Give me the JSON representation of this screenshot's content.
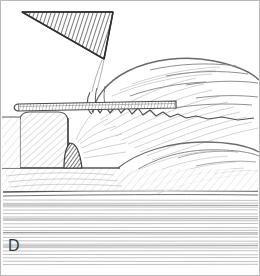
{
  "figure": {
    "panel_label": "D",
    "caption_text": "",
    "background_color": "#ffffff",
    "border_color": "#b9b9b9",
    "ink_color": "#3a3a3a",
    "hatch_color": "#9a9a9a",
    "dark_fill_color": "#6e6e6e",
    "width": 260,
    "height": 276
  },
  "elements": {
    "wedge_triangle": {
      "name": "hatched-triangle-wedge",
      "description": "dark diagonally hatched triangle, upper left, apex pointing down-right",
      "points": "22,12 113,12 104,59",
      "fill": "#8d8d8d"
    },
    "blade_plate": {
      "name": "horizontal-blade-plate",
      "description": "thin hatched horizontal plate crossing the mid-left",
      "y": 105,
      "x_start": 18,
      "x_end": 175
    },
    "lower_block": {
      "name": "rounded-block",
      "description": "rounded rectangular block lower left with diagonal hatching",
      "x": 20,
      "y": 112,
      "width": 48,
      "height": 62
    },
    "small_wedge": {
      "name": "small-dark-wedge",
      "description": "small dark triangular wedge at center base",
      "points": "68,145 80,143 82,168 66,168",
      "fill": "#7d7d7d"
    },
    "organic_mass": {
      "name": "organic-tissue-mass",
      "description": "large curved organic form occupying right half with fine sketch hatching and serrated lower contour"
    },
    "ground_hatching": {
      "name": "ground-line-hatching",
      "description": "dense horizontal line hatching forming the base/substrate across the bottom third",
      "top": 192,
      "bottom": 268,
      "line_count": 26
    }
  }
}
